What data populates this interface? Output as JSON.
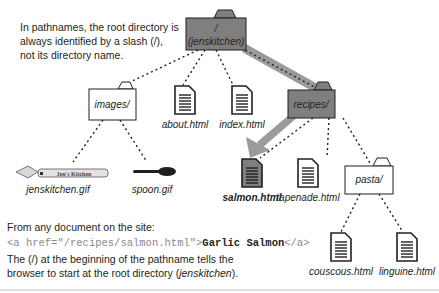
{
  "intro_note": "In pathnames, the root directory is always identified by a slash (/), not its directory name.",
  "tree": {
    "root": {
      "line1": "/",
      "line2": "(jenskitchen)"
    },
    "folders": {
      "images": "images/",
      "recipes": "recipes/",
      "pasta": "pasta/"
    },
    "files": {
      "about": "about.html",
      "index": "index.html",
      "jenskitchen_gif": "jenskitchen.gif",
      "spoon_gif": "spoon.gif",
      "salmon": "salmon.html",
      "tapenade": "tapenade.html",
      "couscous": "couscous.html",
      "linguine": "linguine.html"
    },
    "logo_text": "Jen's Kitchen"
  },
  "example": {
    "heading": "From any document on the site:",
    "code_open": "<a href=\"/recipes/salmon.html\">",
    "code_link_text": "Garlic Salmon",
    "code_close": "</a>",
    "explanation_pre": "The (/) at the beginning of the pathname tells the browser to start at the root directory (",
    "explanation_em": "jenskitchen",
    "explanation_post": ")."
  },
  "colors": {
    "highlight": "#7f7f7f",
    "path_arrow": "#9b9b9b",
    "ink": "#231f20"
  }
}
